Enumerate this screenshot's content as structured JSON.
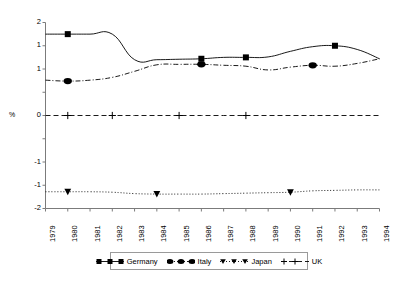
{
  "chart_data": {
    "type": "line",
    "title": "",
    "xlabel": "",
    "ylabel": "%",
    "x": [
      1979,
      1980,
      1981,
      1982,
      1983,
      1984,
      1985,
      1986,
      1987,
      1988,
      1989,
      1990,
      1991,
      1992,
      1993,
      1994
    ],
    "xticklabels": [
      "1979",
      "1980",
      "1981",
      "1982",
      "1983",
      "1984",
      "1985",
      "1986",
      "1987",
      "1988",
      "1989",
      "1990",
      "1991",
      "1992",
      "1993",
      "1994"
    ],
    "xlim": [
      1979,
      1994
    ],
    "ylim": [
      -2,
      2
    ],
    "yticks": [
      2,
      1.5,
      1,
      0.5,
      0,
      -0.5,
      -1,
      -1.5,
      -2
    ],
    "yticklabels": [
      "2",
      "1",
      "1",
      "0",
      "-1",
      "-1",
      "-2"
    ],
    "ytick_values_shown": [
      2,
      1,
      1,
      0,
      -1,
      -1,
      -2
    ],
    "grid": false,
    "legend_position": "bottom",
    "series": [
      {
        "name": "Germany",
        "marker": "square",
        "linestyle": "solid",
        "color": "#000000",
        "values": [
          1.75,
          1.75,
          1.75,
          1.75,
          1.2,
          1.2,
          1.21,
          1.22,
          1.25,
          1.25,
          1.26,
          1.38,
          1.48,
          1.5,
          1.42,
          1.22
        ],
        "marker_years": [
          1980,
          1986,
          1988,
          1992
        ]
      },
      {
        "name": "Italy",
        "marker": "circle",
        "linestyle": "dashdot",
        "color": "#000000",
        "values": [
          0.76,
          0.74,
          0.76,
          0.82,
          0.95,
          1.09,
          1.1,
          1.1,
          1.08,
          1.06,
          0.98,
          1.04,
          1.08,
          1.06,
          1.12,
          1.22
        ],
        "marker_years": [
          1980,
          1986,
          1991
        ]
      },
      {
        "name": "Japan",
        "marker": "triangle-down",
        "linestyle": "dotted",
        "color": "#000000",
        "values": [
          -1.64,
          -1.64,
          -1.64,
          -1.65,
          -1.68,
          -1.69,
          -1.69,
          -1.69,
          -1.68,
          -1.67,
          -1.66,
          -1.65,
          -1.62,
          -1.61,
          -1.6,
          -1.6
        ],
        "marker_years": [
          1980,
          1984,
          1990
        ]
      },
      {
        "name": "UK",
        "marker": "plus",
        "linestyle": "dashed",
        "color": "#000000",
        "values": [
          0,
          0,
          0,
          0,
          0,
          0,
          0,
          0,
          0,
          0,
          0,
          0,
          0,
          0,
          0,
          0
        ],
        "marker_years": [
          1980,
          1982,
          1985,
          1988
        ]
      }
    ]
  },
  "legend": {
    "entries": [
      {
        "label": "Germany",
        "marker": "square"
      },
      {
        "label": "Italy",
        "marker": "circle"
      },
      {
        "label": "Japan",
        "marker": "triangle-down"
      },
      {
        "label": "UK",
        "marker": "plus"
      }
    ]
  }
}
